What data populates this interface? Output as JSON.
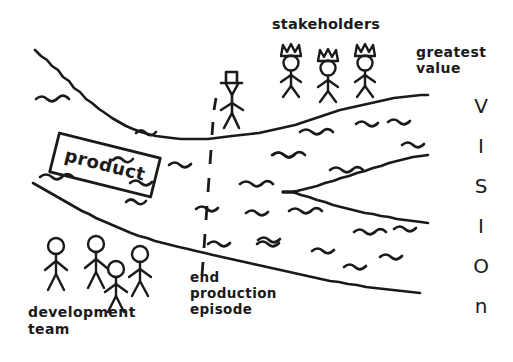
{
  "diagram": {
    "kind": "hand-drawn-sketch",
    "title_visible": false,
    "background_color": "#ffffff",
    "ink_color": "#1a1a1a",
    "labels": {
      "stakeholders": "stakeholders",
      "greatest_value_line1": "greatest",
      "greatest_value_line2": "value",
      "product": "product",
      "end_line1": "end",
      "end_line2": "production",
      "end_line3": "episode",
      "dev_team_line1": "development",
      "dev_team_line2": "team"
    },
    "vision_letters": [
      "V",
      "I",
      "S",
      "I",
      "O",
      "n"
    ],
    "figures": {
      "stakeholders_count": 3,
      "stakeholder_icon": "crowned-stick-figure",
      "dev_team_count": 4,
      "dev_team_icon": "stick-figure",
      "lone_figure_icon": "stick-figure-with-hat"
    },
    "marks": {
      "divider_icon": "vertical-dashed-line",
      "river_icon": "widening-river-banks",
      "ripple_icon": "water-ripple-squiggle",
      "product_box_icon": "rotated-rectangle-label"
    }
  }
}
